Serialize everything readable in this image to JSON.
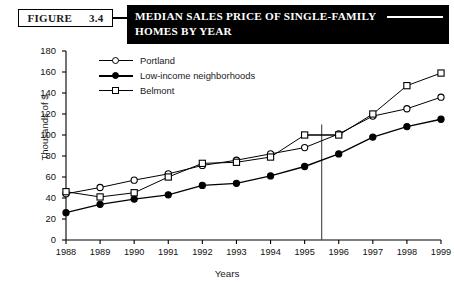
{
  "header": {
    "figure_word": "FIGURE",
    "figure_number": "3.4",
    "title_line1": "MEDIAN SALES PRICE OF SINGLE-FAMILY",
    "title_line2": "HOMES BY YEAR"
  },
  "chart_data": {
    "type": "line",
    "title": "MEDIAN SALES PRICE OF SINGLE-FAMILY HOMES BY YEAR",
    "xlabel": "Years",
    "ylabel": "Thousands of $",
    "categories": [
      "1988",
      "1989",
      "1990",
      "1991",
      "1992",
      "1993",
      "1994",
      "1995",
      "1996",
      "1997",
      "1998",
      "1999"
    ],
    "x": [
      1988,
      1989,
      1990,
      1991,
      1992,
      1993,
      1994,
      1995,
      1996,
      1997,
      1998,
      1999
    ],
    "xlim": [
      1988,
      1999
    ],
    "ylim": [
      0,
      180
    ],
    "yticks": [
      0,
      20,
      40,
      60,
      80,
      100,
      120,
      140,
      160,
      180
    ],
    "grid": false,
    "legend_position": "top-left-inside",
    "series": [
      {
        "name": "Portland",
        "marker": "open-circle",
        "values": [
          44,
          50,
          57,
          63,
          71,
          76,
          82,
          88,
          101,
          118,
          125,
          136
        ]
      },
      {
        "name": "Low-income neighborhoods",
        "marker": "filled-circle",
        "values": [
          26,
          34,
          39,
          43,
          52,
          54,
          61,
          70,
          82,
          98,
          108,
          115
        ]
      },
      {
        "name": "Belmont",
        "marker": "open-square",
        "values": [
          46,
          41,
          45,
          60,
          73,
          74,
          79,
          100,
          100,
          120,
          147,
          159
        ]
      }
    ],
    "annotations": [
      {
        "name": "vertical-reference-line",
        "type": "vline",
        "x": 1995.5,
        "y_from": 0,
        "y_to": 110
      },
      {
        "name": "horizontal-reference-line",
        "type": "hline",
        "y": 100,
        "x_from": 1995,
        "x_to": 1996
      }
    ]
  }
}
